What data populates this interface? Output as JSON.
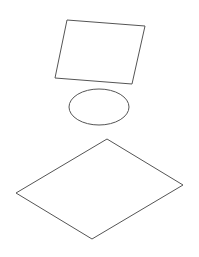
{
  "canvas": {
    "width": 199,
    "height": 257,
    "background": "#ffffff"
  },
  "stroke": {
    "color": "#555555",
    "width": 1
  },
  "shapes": [
    {
      "type": "parallelogram",
      "points": "67,20 145,26 132,84 55,78"
    },
    {
      "type": "ellipse",
      "cx": 99,
      "cy": 107,
      "rx": 30,
      "ry": 18
    },
    {
      "type": "diamond",
      "points": "107,139 183,185 92,239 16,193"
    }
  ]
}
